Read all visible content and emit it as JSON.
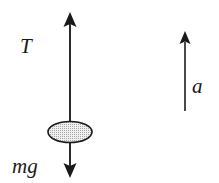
{
  "figure": {
    "background_color": "#ffffff",
    "width": 219,
    "height": 183,
    "stroke_color": "#1a1a1a",
    "labels": {
      "tension": "T",
      "weight": "mg",
      "acceleration": "a"
    },
    "body": {
      "shape": "ellipse",
      "name": "mass",
      "center_x": 70,
      "center_y": 132,
      "radius_x": 22,
      "radius_y": 10.5,
      "fill_color": "#e6e6e6",
      "stipple_dot_color": "#9a9a9a",
      "outline_color": "#1a1a1a"
    },
    "arrows": [
      {
        "name": "tension-arrow",
        "label": "T",
        "direction": "up",
        "x": 70,
        "tip_y": 12,
        "tail_y": 132,
        "head_width": 13,
        "head_length": 15,
        "shaft_width": 2
      },
      {
        "name": "weight-arrow",
        "label": "mg",
        "direction": "down",
        "x": 70,
        "tip_y": 178,
        "tail_y": 132,
        "head_width": 13,
        "head_length": 15,
        "shaft_width": 2
      },
      {
        "name": "acceleration-arrow",
        "label": "a",
        "direction": "up",
        "x": 185,
        "tip_y": 31,
        "tail_y": 111,
        "head_width": 11,
        "head_length": 13,
        "shaft_width": 2
      }
    ]
  }
}
